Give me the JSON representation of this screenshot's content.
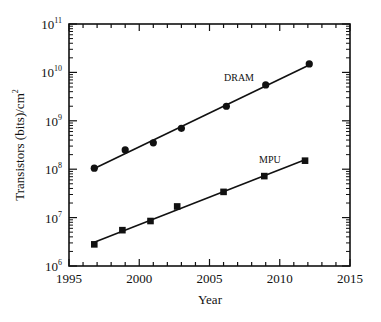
{
  "chart_data": {
    "type": "scatter",
    "title": "",
    "xlabel": "Year",
    "ylabel": "Transistors (bits)/cm²",
    "yscale": "log",
    "xlim": [
      1995,
      2015
    ],
    "ylim": [
      1000000,
      100000000000
    ],
    "xticks": [
      1995,
      2000,
      2005,
      2010,
      2015
    ],
    "ytick_exponents": [
      6,
      7,
      8,
      9,
      10,
      11
    ],
    "grid": false,
    "legend": "inline labels",
    "series": [
      {
        "name": "DRAM",
        "marker": "circle",
        "fit_line": true,
        "x": [
          1996.8,
          1999.0,
          2001.0,
          2003.0,
          2006.2,
          2009.0,
          2012.1
        ],
        "values": [
          105000000,
          250000000,
          350000000,
          700000000,
          2000000000,
          5500000000,
          15000000000
        ]
      },
      {
        "name": "MPU",
        "marker": "square",
        "fit_line": true,
        "x": [
          1996.8,
          1998.8,
          2000.8,
          2002.7,
          2006.0,
          2008.9,
          2011.8
        ],
        "values": [
          2800000,
          5500000,
          8500000,
          17000000,
          34000000,
          72000000,
          150000000
        ]
      }
    ]
  },
  "labels": {
    "xlabel": "Year",
    "ylabel_main": "Transistors (bits)/cm",
    "ylabel_sup": "2",
    "dram": "DRAM",
    "mpu": "MPU"
  }
}
